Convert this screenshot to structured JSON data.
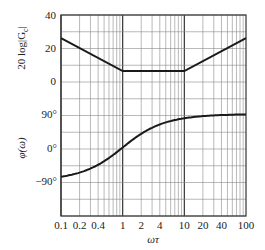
{
  "chart_data": [
    {
      "type": "line",
      "title": "",
      "xlabel": "ωτ",
      "ylabel": "20 log|Gc|",
      "xscale": "log",
      "xlim": [
        0.1,
        100
      ],
      "ylim": [
        0,
        40
      ],
      "yticks": [
        0,
        20,
        40
      ],
      "ytick_labels": [
        "0",
        "20",
        "40"
      ],
      "grid": true,
      "series": [
        {
          "name": "magnitude (asymptotic)",
          "x": [
            0.1,
            1,
            10,
            100
          ],
          "values": [
            26,
            6,
            6,
            26
          ]
        }
      ]
    },
    {
      "type": "line",
      "title": "",
      "xlabel": "ωτ",
      "ylabel": "φ(ω)",
      "xscale": "log",
      "xlim": [
        0.1,
        100
      ],
      "ylim": [
        -150,
        90
      ],
      "yticks": [
        -90,
        0,
        90
      ],
      "ytick_labels": [
        "−90°",
        "0°",
        "90°"
      ],
      "grid": true,
      "series": [
        {
          "name": "phase",
          "x": [
            0.1,
            0.2,
            0.4,
            1,
            2,
            4,
            10,
            20,
            40,
            100
          ],
          "values": [
            -89,
            -84,
            -75,
            -45,
            -15,
            15,
            45,
            68,
            80,
            88
          ]
        }
      ]
    }
  ],
  "axes": {
    "mag_ylabel": "20 log|G",
    "mag_ylabel_sub": "c",
    "mag_ylabel_end": "|",
    "phase_ylabel": "φ(ω)",
    "xlabel": "ωτ",
    "mag_ticks": [
      {
        "label": "40",
        "v": 40
      },
      {
        "label": "20",
        "v": 20
      },
      {
        "label": "0",
        "v": 0
      }
    ],
    "phase_ticks": [
      {
        "label": "90°",
        "v": 90
      },
      {
        "label": "0°",
        "v": 0
      },
      {
        "label": "−90°",
        "v": -90
      }
    ],
    "x_ticks": [
      {
        "label": "0.1",
        "v": 0.1
      },
      {
        "label": "0.2",
        "v": 0.2
      },
      {
        "label": "0.4",
        "v": 0.4
      },
      {
        "label": "1",
        "v": 1
      },
      {
        "label": "2",
        "v": 2
      },
      {
        "label": "4",
        "v": 4
      },
      {
        "label": "10",
        "v": 10
      },
      {
        "label": "20",
        "v": 20
      },
      {
        "label": "40",
        "v": 40
      },
      {
        "label": "100",
        "v": 100
      }
    ]
  },
  "colors": {
    "line": "#1a1a1a",
    "grid": "#7a7a7a",
    "frame": "#333333"
  }
}
